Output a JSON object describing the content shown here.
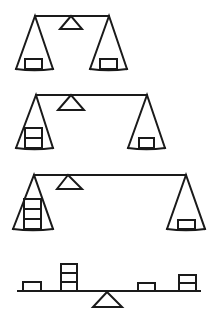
{
  "colors": {
    "ink": "#1a1a1a",
    "background": "#ffffff"
  },
  "scales": [
    {
      "id": "balance-1",
      "beam": {
        "x1": 35,
        "x2": 109,
        "y": 16
      },
      "fulcrum": {
        "apex_x": 71,
        "apex_y": 16,
        "base_y": 29,
        "base_x1": 60,
        "base_x2": 82
      },
      "pans": [
        {
          "side": "left",
          "apex_x": 35,
          "apex_y": 16,
          "base_y": 69,
          "base_x1": 16,
          "base_x2": 53,
          "box_x": 25,
          "box_w": 17,
          "box_h": 10,
          "box_count": 1
        },
        {
          "side": "right",
          "apex_x": 109,
          "apex_y": 16,
          "base_y": 69,
          "base_x1": 90,
          "base_x2": 127,
          "box_x": 100,
          "box_w": 17,
          "box_h": 10,
          "box_count": 1
        }
      ]
    },
    {
      "id": "balance-2",
      "beam": {
        "x1": 36,
        "x2": 147,
        "y": 95
      },
      "fulcrum": {
        "apex_x": 71,
        "apex_y": 95,
        "base_y": 110,
        "base_x1": 58,
        "base_x2": 84
      },
      "pans": [
        {
          "side": "left",
          "apex_x": 36,
          "apex_y": 95,
          "base_y": 148,
          "base_x1": 16,
          "base_x2": 53,
          "box_x": 25,
          "box_w": 17,
          "box_h": 10,
          "box_count": 2
        },
        {
          "side": "right",
          "apex_x": 147,
          "apex_y": 95,
          "base_y": 148,
          "base_x1": 128,
          "base_x2": 165,
          "box_x": 139,
          "box_w": 15,
          "box_h": 10,
          "box_count": 1
        }
      ]
    },
    {
      "id": "balance-3",
      "beam": {
        "x1": 34,
        "x2": 186,
        "y": 175
      },
      "fulcrum": {
        "apex_x": 68,
        "apex_y": 175,
        "base_y": 189,
        "base_x1": 57,
        "base_x2": 82
      },
      "pans": [
        {
          "side": "left",
          "apex_x": 34,
          "apex_y": 175,
          "base_y": 229,
          "base_x1": 13,
          "base_x2": 53,
          "box_x": 24,
          "box_w": 17,
          "box_h": 10,
          "box_count": 3
        },
        {
          "side": "right",
          "apex_x": 186,
          "apex_y": 175,
          "base_y": 229,
          "base_x1": 167,
          "base_x2": 205,
          "box_x": 178,
          "box_w": 17,
          "box_h": 9,
          "box_count": 1
        }
      ]
    }
  ],
  "seesaw": {
    "id": "seesaw-lever",
    "beam": {
      "x1": 18,
      "x2": 200,
      "y": 291
    },
    "fulcrum": {
      "apex_x": 107,
      "apex_y": 292,
      "base_y": 307,
      "base_x1": 93,
      "base_x2": 122
    },
    "stacks": [
      {
        "position": "far-left",
        "x": 23,
        "w": 18,
        "h": 9,
        "box_count": 1
      },
      {
        "position": "near-left",
        "x": 61,
        "w": 16,
        "h": 9,
        "box_count": 3
      },
      {
        "position": "near-right",
        "x": 138,
        "w": 17,
        "h": 8,
        "box_count": 1
      },
      {
        "position": "far-right",
        "x": 179,
        "w": 17,
        "h": 8,
        "box_count": 2
      }
    ]
  }
}
